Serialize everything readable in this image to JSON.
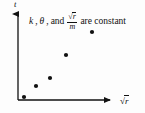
{
  "figure": {
    "background_color": "#fdfdfd",
    "ink_color": "#111111"
  },
  "annotation": {
    "part1": "k",
    "comma1": ",",
    "part2": "θ",
    "comma2": ",",
    "conjunction": "and",
    "fraction_numerator_radical": "√",
    "fraction_numerator_radicand": "r",
    "fraction_denominator": "m",
    "part3": "are constant",
    "full_text": "k, θ, and √r/m are constant"
  },
  "axes": {
    "y_label": "t",
    "x_label_radical": "√",
    "x_label_radicand": "r",
    "x_label_full": "√r",
    "origin_x": 18,
    "origin_y": 100,
    "x_axis_end": 116,
    "y_axis_top": 11,
    "arrowheads": true,
    "ticks": false,
    "gridlines": false
  },
  "chart_data": {
    "type": "scatter",
    "title": "",
    "subtitle": "",
    "xlabel": "√r",
    "ylabel": "t",
    "annotations": [
      "k, θ, and √r/m are constant"
    ],
    "legend": [],
    "legend_position": "none",
    "grid": false,
    "axis_ticks": false,
    "xlim": [
      0,
      1
    ],
    "ylim": [
      0,
      1
    ],
    "marker": "filled-circle",
    "marker_color": "#111111",
    "marker_size_px": 4.2,
    "series": [
      {
        "name": "data",
        "points_px": [
          {
            "x": 24,
            "y": 97
          },
          {
            "x": 36,
            "y": 86
          },
          {
            "x": 50,
            "y": 78
          },
          {
            "x": 66,
            "y": 55
          },
          {
            "x": 92,
            "y": 32
          }
        ],
        "x": [
          0.061,
          0.184,
          0.327,
          0.49,
          0.755
        ],
        "y": [
          0.034,
          0.157,
          0.247,
          0.506,
          0.764
        ]
      }
    ]
  }
}
